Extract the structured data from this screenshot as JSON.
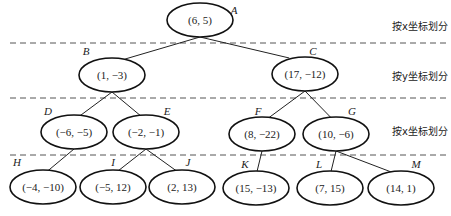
{
  "diagram": {
    "type": "kd-tree",
    "split_labels": [
      {
        "text": "按x坐标划分",
        "x": 392,
        "y": 30
      },
      {
        "text": "按y坐标划分",
        "x": 392,
        "y": 80
      },
      {
        "text": "按x坐标划分",
        "x": 392,
        "y": 135
      }
    ],
    "dashed_lines_y": [
      43,
      98,
      155
    ],
    "nodes": [
      {
        "id": "A",
        "value": "(6, 5)",
        "cx": 200,
        "cy": 20,
        "lx": 234,
        "ly": 14
      },
      {
        "id": "B",
        "value": "(1, −3)",
        "cx": 112,
        "cy": 75,
        "lx": 86,
        "ly": 55
      },
      {
        "id": "C",
        "value": "(17, −12)",
        "cx": 305,
        "cy": 74,
        "lx": 313,
        "ly": 55
      },
      {
        "id": "D",
        "value": "(−6, −5)",
        "cx": 74,
        "cy": 132,
        "lx": 48,
        "ly": 115
      },
      {
        "id": "E",
        "value": "(−2, −1)",
        "cx": 146,
        "cy": 132,
        "lx": 167,
        "ly": 115
      },
      {
        "id": "F",
        "value": "(8, −22)",
        "cx": 262,
        "cy": 134,
        "lx": 258,
        "ly": 115
      },
      {
        "id": "G",
        "value": "(10, −6)",
        "cx": 336,
        "cy": 134,
        "lx": 352,
        "ly": 115
      },
      {
        "id": "H",
        "value": "(−4, −10)",
        "cx": 43,
        "cy": 187,
        "lx": 17,
        "ly": 166
      },
      {
        "id": "I",
        "value": "(−5, 12)",
        "cx": 113,
        "cy": 187,
        "lx": 113,
        "ly": 166
      },
      {
        "id": "J",
        "value": "(2, 13)",
        "cx": 182,
        "cy": 187,
        "lx": 188,
        "ly": 166
      },
      {
        "id": "K",
        "value": "(15, −13)",
        "cx": 256,
        "cy": 188,
        "lx": 245,
        "ly": 168
      },
      {
        "id": "L",
        "value": "(7, 15)",
        "cx": 330,
        "cy": 188,
        "lx": 319,
        "ly": 168
      },
      {
        "id": "M",
        "value": "(14, 1)",
        "cx": 401,
        "cy": 188,
        "lx": 416,
        "ly": 168
      }
    ],
    "edges": [
      [
        "A",
        "B"
      ],
      [
        "A",
        "C"
      ],
      [
        "B",
        "D"
      ],
      [
        "B",
        "E"
      ],
      [
        "C",
        "F"
      ],
      [
        "C",
        "G"
      ],
      [
        "D",
        "H"
      ],
      [
        "E",
        "I"
      ],
      [
        "E",
        "J"
      ],
      [
        "F",
        "K"
      ],
      [
        "G",
        "L"
      ],
      [
        "G",
        "M"
      ]
    ]
  }
}
